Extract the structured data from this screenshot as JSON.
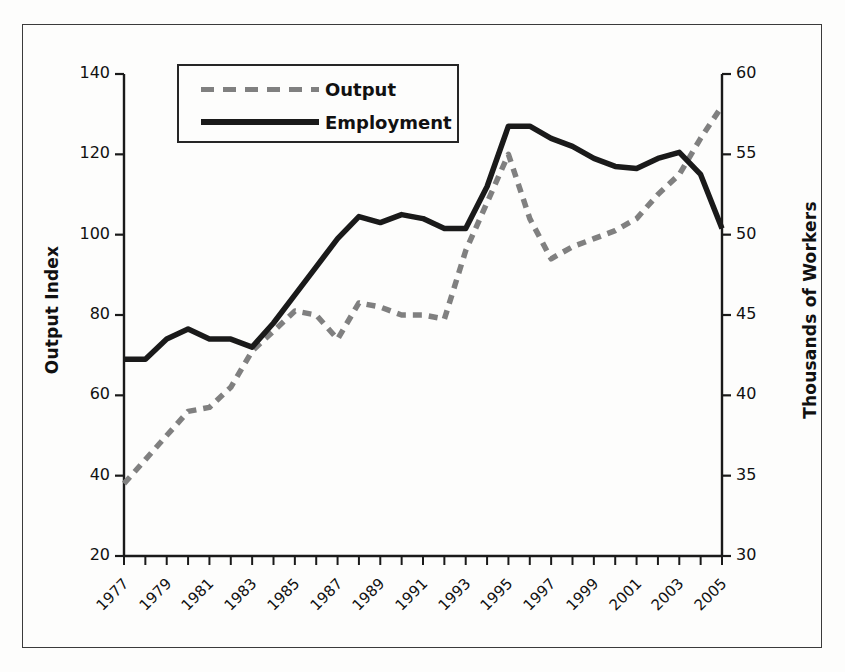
{
  "chart_data": {
    "type": "line",
    "title": "",
    "xlabel": "",
    "ylabel": "Output Index",
    "y2label": "Thousands of Workers",
    "ylim": [
      20,
      140
    ],
    "y2lim": [
      30,
      60
    ],
    "xlim": [
      1977,
      2005
    ],
    "grid": false,
    "legend_position": "top-left-inside",
    "x": [
      1977,
      1978,
      1979,
      1980,
      1981,
      1982,
      1983,
      1984,
      1985,
      1986,
      1987,
      1988,
      1989,
      1990,
      1991,
      1992,
      1993,
      1994,
      1995,
      1996,
      1997,
      1998,
      1999,
      2000,
      2001,
      2002,
      2003,
      2004,
      2005
    ],
    "xtick_labels": [
      "1977",
      "1979",
      "1981",
      "1983",
      "1985",
      "1987",
      "1989",
      "1991",
      "1993",
      "1995",
      "1997",
      "1999",
      "2001",
      "2003",
      "2005"
    ],
    "ytick_labels": [
      "20",
      "40",
      "60",
      "80",
      "100",
      "120",
      "140"
    ],
    "y2tick_labels": [
      "30",
      "35",
      "40",
      "45",
      "50",
      "55",
      "60"
    ],
    "series": [
      {
        "name": "Output",
        "axis": "left",
        "style": "dashed",
        "color": "#808080",
        "values": [
          38,
          44,
          50,
          56,
          57,
          62,
          71,
          76,
          81,
          80,
          74,
          83,
          82,
          80,
          80,
          79,
          96,
          108,
          120,
          104,
          94,
          97,
          99,
          101,
          104,
          110,
          115,
          124,
          132
        ]
      },
      {
        "name": "Employment",
        "axis": "right",
        "style": "solid",
        "color": "#1a1a1a",
        "values_index_scale": [
          69,
          69,
          74,
          76.5,
          74,
          74,
          72,
          78,
          85,
          92,
          99,
          104.5,
          103,
          105,
          104,
          101.5,
          101.5,
          112,
          127,
          127,
          124,
          122,
          119,
          117,
          116.5,
          119,
          120.5,
          115,
          101.5
        ],
        "values": [
          42.2,
          42.2,
          43.5,
          44.1,
          43.5,
          43.5,
          43.0,
          44.5,
          46.2,
          48.0,
          49.7,
          51.1,
          50.7,
          51.2,
          51.0,
          50.4,
          50.4,
          53.0,
          56.7,
          56.7,
          56.0,
          55.5,
          54.7,
          54.2,
          54.1,
          54.7,
          55.1,
          53.7,
          50.4
        ]
      }
    ]
  },
  "axes": {
    "left_title": "Output Index",
    "right_title": "Thousands of Workers"
  },
  "legend": {
    "items": [
      {
        "label": "Output",
        "style": "dashed",
        "color": "#808080"
      },
      {
        "label": "Employment",
        "style": "solid",
        "color": "#1a1a1a"
      }
    ]
  }
}
